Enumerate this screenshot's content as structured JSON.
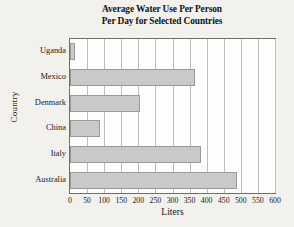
{
  "chart_data": {
    "type": "bar",
    "orientation": "horizontal",
    "title": "Average Water Use Per Person Per Day for Selected Countries",
    "title_lines": [
      "Average Water Use Per Person",
      "Per Day for Selected Countries"
    ],
    "xlabel": "Liters",
    "ylabel": "Country",
    "categories": [
      "Uganda",
      "Mexico",
      "Denmark",
      "China",
      "Italy",
      "Australia"
    ],
    "values": [
      15,
      365,
      205,
      88,
      383,
      490
    ],
    "xlim": [
      0,
      600
    ],
    "xticks": [
      0,
      50,
      100,
      150,
      200,
      250,
      300,
      350,
      400,
      450,
      500,
      550,
      600
    ],
    "xtick_labels": [
      "0",
      "50",
      "100",
      "150",
      "200",
      "250",
      "300",
      "350",
      "400",
      "450",
      "500",
      "550",
      "600"
    ],
    "grid": true,
    "grid_axis": "x",
    "legend": false,
    "bar_color": "#c9c9c9",
    "bar_edge_color": "#9a9a9a",
    "plot_background": "#fdfdfb",
    "figure_background": "#f3f1ed",
    "axis_color": "#6e6e6e",
    "gridline_color": "#bdbdbd"
  }
}
